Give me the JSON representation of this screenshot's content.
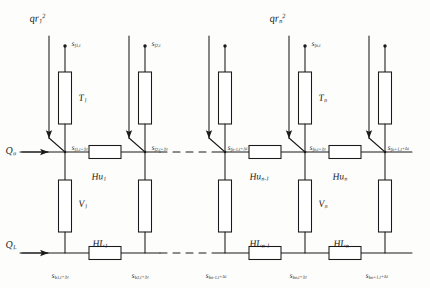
{
  "figure": {
    "type": "network-schematic",
    "columns": 5,
    "line_color": "#1a1a1a",
    "background": "#fdfdfc"
  },
  "inflow_labels": [
    {
      "id": "qr1",
      "text_html": "qr<sub>1</sub><sup>2</sup>",
      "x": 30,
      "y": 14
    },
    {
      "id": "qrn",
      "text_html": "qr<sub>n</sub><sup>2</sup>",
      "x": 270,
      "y": 14
    }
  ],
  "rails": {
    "upper": {
      "label_html": "Q<sub>u</sub>",
      "label_x": 6,
      "label_y": 146,
      "y": 152
    },
    "lower": {
      "label_html": "Q<sub>L</sub>",
      "label_x": 6,
      "label_y": 240,
      "y": 253
    }
  },
  "columns": [
    {
      "index": 1,
      "x": 65,
      "source_label_html": "s<sub>f1,t</sub>",
      "source_label_x": 72,
      "source_label_y": 40,
      "node_label_html": "s<sub>f1,t+&#8710;t</sub>",
      "node_label_x": 72,
      "node_label_y": 144,
      "bottom_label_html": "s<sub>b1,t+&#8710;t</sub>",
      "bottom_label_x": 52,
      "bottom_label_y": 272,
      "upper_resistor_label": "T",
      "upper_resistor_sub": "1",
      "lower_resistor_label": "V",
      "lower_resistor_sub": "1",
      "has_inflow_arrow": true
    },
    {
      "index": 2,
      "x": 145,
      "source_label_html": "s<sub>f2,t</sub>",
      "source_label_x": 152,
      "source_label_y": 40,
      "node_label_html": "s<sub>f2,t+&#8710;t</sub>",
      "node_label_x": 152,
      "node_label_y": 144,
      "bottom_label_html": "s<sub>b2,t+&#8710;t</sub>",
      "bottom_label_x": 132,
      "bottom_label_y": 272,
      "upper_resistor_label": "",
      "upper_resistor_sub": "",
      "lower_resistor_label": "",
      "lower_resistor_sub": "",
      "has_inflow_arrow": true
    },
    {
      "index": 3,
      "x": 225,
      "source_label_html": "",
      "source_label_x": 232,
      "source_label_y": 40,
      "node_label_html": "s<sub>fn-1,t+&#8710;t</sub>",
      "node_label_x": 228,
      "node_label_y": 144,
      "bottom_label_html": "s<sub>bn-1,t+&#8710;t</sub>",
      "bottom_label_x": 206,
      "bottom_label_y": 272,
      "upper_resistor_label": "",
      "upper_resistor_sub": "",
      "lower_resistor_label": "",
      "lower_resistor_sub": "",
      "has_inflow_arrow": true
    },
    {
      "index": 4,
      "x": 305,
      "source_label_html": "s<sub>fn,t</sub>",
      "source_label_x": 312,
      "source_label_y": 40,
      "node_label_html": "s<sub>fn,t+&#8710;t</sub>",
      "node_label_x": 310,
      "node_label_y": 144,
      "bottom_label_html": "s<sub>bn,t+&#8710;t</sub>",
      "bottom_label_x": 290,
      "bottom_label_y": 272,
      "upper_resistor_label": "T",
      "upper_resistor_sub": "n",
      "lower_resistor_label": "V",
      "lower_resistor_sub": "n",
      "has_inflow_arrow": true
    },
    {
      "index": 5,
      "x": 385,
      "source_label_html": "",
      "source_label_x": 392,
      "source_label_y": 40,
      "node_label_html": "s<sub>fn+1,t+&#8710;t</sub>",
      "node_label_x": 388,
      "node_label_y": 144,
      "bottom_label_html": "s<sub>bn+1,t+&#8710;t</sub>",
      "bottom_label_x": 366,
      "bottom_label_y": 272,
      "upper_resistor_label": "",
      "upper_resistor_sub": "",
      "lower_resistor_label": "",
      "lower_resistor_sub": "",
      "has_inflow_arrow": true
    }
  ],
  "upper_rail_resistors": [
    {
      "id": "Hu1",
      "label_html": "Hu<sub>1</sub>",
      "cx": 105,
      "label_x": 92,
      "label_y": 173
    },
    {
      "id": "Hun-1",
      "label_html": "Hu<sub>n-1</sub>",
      "cx": 265,
      "label_x": 250,
      "label_y": 173
    },
    {
      "id": "Hun",
      "label_html": "Hu<sub>n</sub>",
      "cx": 345,
      "label_x": 333,
      "label_y": 173
    }
  ],
  "lower_rail_resistors": [
    {
      "id": "HL1",
      "label_html": "HL<sub>1</sub>",
      "cx": 105,
      "label_x": 93,
      "label_y": 240
    },
    {
      "id": "HLn-1",
      "label_html": "HL<sub>n-1</sub>",
      "cx": 265,
      "label_x": 250,
      "label_y": 240
    },
    {
      "id": "HLn",
      "label_html": "HL<sub>n</sub>",
      "cx": 345,
      "label_x": 334,
      "label_y": 240
    }
  ],
  "dashed_gaps": [
    {
      "rail": "upper",
      "x1": 160,
      "x2": 212,
      "y": 152
    },
    {
      "rail": "lower",
      "x1": 160,
      "x2": 212,
      "y": 253
    }
  ],
  "geometry": {
    "arrow_line_offset": -16,
    "arrow_top_y": 36,
    "source_dot_y": 46,
    "upper_resistor_top": 72,
    "upper_resistor_bottom": 124,
    "lower_resistor_top": 180,
    "lower_resistor_bottom": 232,
    "resistor_width": 13,
    "rail_resistor_width": 32,
    "rail_resistor_height": 13
  }
}
